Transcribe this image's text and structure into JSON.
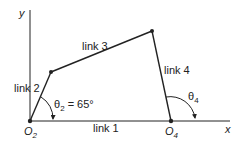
{
  "diagram": {
    "axes": {
      "x_label": "x",
      "y_label": "y"
    },
    "pivots": {
      "o2": "O",
      "o2_sub": "2",
      "o4": "O",
      "o4_sub": "4"
    },
    "links": [
      {
        "id": "link1",
        "label": "link 1"
      },
      {
        "id": "link2",
        "label": "link 2"
      },
      {
        "id": "link3",
        "label": "link 3"
      },
      {
        "id": "link4",
        "label": "link 4"
      }
    ],
    "angles": {
      "theta2_symbol": "θ",
      "theta2_sub": "2",
      "theta2_value": " = 65°",
      "theta4_symbol": "θ",
      "theta4_sub": "4"
    },
    "colors": {
      "line": "#222222",
      "background": "#ffffff"
    }
  }
}
